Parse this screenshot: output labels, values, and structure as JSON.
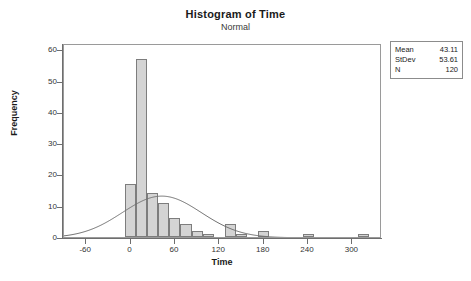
{
  "chart_data": {
    "type": "bar",
    "title": "Histogram of Time",
    "subtitle": "Normal",
    "xlabel": "Time",
    "ylabel": "Frequency",
    "xlim": [
      -90,
      340
    ],
    "ylim": [
      0,
      62
    ],
    "xticks": [
      -60,
      0,
      60,
      120,
      180,
      240,
      300
    ],
    "yticks": [
      0,
      10,
      20,
      30,
      40,
      50,
      60
    ],
    "grid": false,
    "bin_width": 15,
    "bin_starts": [
      -7.5,
      7.5,
      22.5,
      37.5,
      52.5,
      67.5,
      82.5,
      97.5,
      112.5,
      127.5,
      142.5,
      157.5,
      172.5,
      187.5,
      232.5,
      307.5
    ],
    "values": [
      17,
      57,
      14,
      11,
      6,
      4,
      2,
      1,
      0,
      4,
      1,
      0,
      2,
      0,
      1,
      1
    ],
    "categories": [
      "-7.5",
      "7.5",
      "22.5",
      "37.5",
      "52.5",
      "67.5",
      "82.5",
      "97.5",
      "112.5",
      "127.5",
      "142.5",
      "157.5",
      "172.5",
      "187.5",
      "232.5",
      "307.5"
    ],
    "overlay_curve": {
      "name": "Normal",
      "mean": 43.11,
      "stdev": 53.61,
      "n": 120,
      "peak_frequency": 18
    },
    "bar_fill_color": "#d4d4d4",
    "bar_edge_color": "#7d7d7d",
    "curve_color": "#6e6e6e"
  },
  "stats_box": {
    "rows": [
      {
        "key": "Mean",
        "value": "43.11"
      },
      {
        "key": "StDev",
        "value": "53.61"
      },
      {
        "key": "N",
        "value": "120"
      }
    ]
  }
}
